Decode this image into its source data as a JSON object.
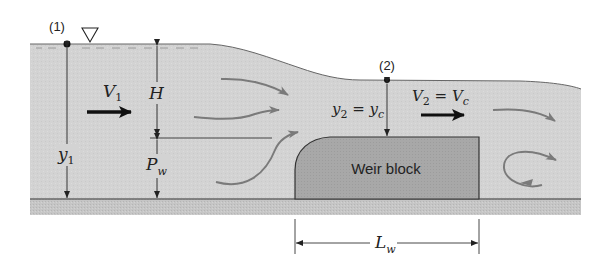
{
  "diagram": {
    "type": "broad-crested weir flow schematic",
    "colors": {
      "water": "#d3d3d3",
      "ground": "#c4c4c4",
      "weir_block": "#a9a9a9",
      "flow_arrows": "#7a7a7a",
      "lines": "#333333",
      "background": "#ffffff"
    },
    "points": [
      {
        "id": "point-1",
        "label": "(1)"
      },
      {
        "id": "point-2",
        "label": "(2)"
      }
    ],
    "labels": {
      "v1_main": "V",
      "v1_sub": "1",
      "y1_main": "y",
      "y1_sub": "1",
      "H": "H",
      "pw_main": "P",
      "pw_sub": "w",
      "y2_main": "y",
      "y2_sub": "2",
      "y2_eq": " = ",
      "yc_main": "y",
      "yc_sub": "c",
      "v2_main": "V",
      "v2_sub": "2",
      "v2_eq": " = ",
      "vc_main": "V",
      "vc_sub": "c",
      "weir_block": "Weir block",
      "lw_main": "L",
      "lw_sub": "w"
    },
    "icons": {
      "free_surface_symbol": "inverted-triangle"
    }
  }
}
